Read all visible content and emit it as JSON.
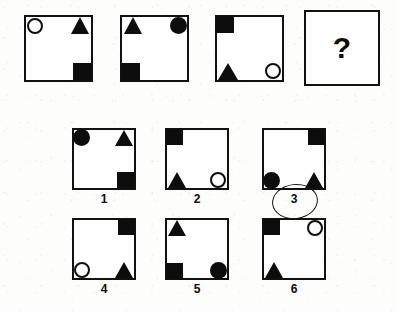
{
  "puzzle": {
    "type": "matrix-reasoning-visual-analogy",
    "question_mark": "?",
    "selected_answer": "3",
    "prompt_row": [
      {
        "index": 1,
        "name": "prompt-panel-1",
        "shapes": [
          {
            "kind": "circle-open",
            "corner": "top-left"
          },
          {
            "kind": "triangle-filled",
            "corner": "top-right"
          },
          {
            "kind": "square-filled",
            "corner": "bottom-right"
          }
        ]
      },
      {
        "index": 2,
        "name": "prompt-panel-2",
        "shapes": [
          {
            "kind": "triangle-filled",
            "corner": "top-left"
          },
          {
            "kind": "circle-filled",
            "corner": "top-right"
          },
          {
            "kind": "square-filled",
            "corner": "bottom-left"
          }
        ]
      },
      {
        "index": 3,
        "name": "prompt-panel-3",
        "shapes": [
          {
            "kind": "square-filled",
            "corner": "top-left"
          },
          {
            "kind": "triangle-filled",
            "corner": "bottom-left"
          },
          {
            "kind": "circle-open",
            "corner": "bottom-right"
          }
        ]
      },
      {
        "index": 4,
        "name": "prompt-panel-question",
        "shapes": [],
        "label": "?"
      }
    ],
    "options": [
      {
        "label": "1",
        "name": "answer-option-1",
        "selected": false,
        "shapes": [
          {
            "kind": "circle-filled",
            "corner": "top-left"
          },
          {
            "kind": "triangle-filled",
            "corner": "top-right"
          },
          {
            "kind": "square-filled",
            "corner": "bottom-right"
          }
        ]
      },
      {
        "label": "2",
        "name": "answer-option-2",
        "selected": false,
        "shapes": [
          {
            "kind": "square-filled",
            "corner": "top-left"
          },
          {
            "kind": "triangle-filled",
            "corner": "bottom-left"
          },
          {
            "kind": "circle-open",
            "corner": "bottom-right"
          }
        ]
      },
      {
        "label": "3",
        "name": "answer-option-3",
        "selected": true,
        "shapes": [
          {
            "kind": "square-filled",
            "corner": "top-right"
          },
          {
            "kind": "circle-filled",
            "corner": "bottom-left"
          },
          {
            "kind": "triangle-filled",
            "corner": "bottom-right"
          }
        ]
      },
      {
        "label": "4",
        "name": "answer-option-4",
        "selected": false,
        "shapes": [
          {
            "kind": "square-filled",
            "corner": "top-right"
          },
          {
            "kind": "circle-open",
            "corner": "bottom-left"
          },
          {
            "kind": "triangle-filled",
            "corner": "bottom-right"
          }
        ]
      },
      {
        "label": "5",
        "name": "answer-option-5",
        "selected": false,
        "shapes": [
          {
            "kind": "triangle-filled",
            "corner": "top-left"
          },
          {
            "kind": "square-filled",
            "corner": "bottom-left"
          },
          {
            "kind": "circle-filled",
            "corner": "bottom-right"
          }
        ]
      },
      {
        "label": "6",
        "name": "answer-option-6",
        "selected": false,
        "shapes": [
          {
            "kind": "square-filled",
            "corner": "top-left"
          },
          {
            "kind": "circle-open",
            "corner": "top-right"
          },
          {
            "kind": "triangle-filled",
            "corner": "bottom-left"
          }
        ]
      }
    ],
    "colors": {
      "ink": "#0d0d0d",
      "paper": "#fdfdfc",
      "frame": "#111111"
    }
  }
}
